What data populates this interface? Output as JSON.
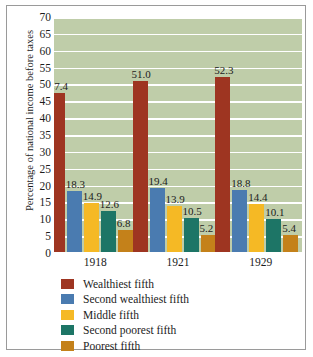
{
  "chart_data": {
    "type": "bar",
    "title": "",
    "subtitle": "",
    "xlabel": "",
    "ylabel": "Percentage of national income before taxes",
    "categories": [
      "1918",
      "1921",
      "1929"
    ],
    "ylim": [
      0,
      70
    ],
    "ytick_step": 5,
    "yticks": [
      "70",
      "65",
      "60",
      "55",
      "50",
      "45",
      "40",
      "35",
      "30",
      "25",
      "20",
      "15",
      "10",
      "5",
      "0"
    ],
    "grid": true,
    "legend_position": "bottom-left",
    "series": [
      {
        "name": "Wealthiest fifth",
        "color": "#9e3521",
        "values": [
          47.4,
          51.0,
          52.3
        ],
        "labels": [
          "47.4",
          "51.0",
          "52.3"
        ]
      },
      {
        "name": "Second wealthiest fifth",
        "color": "#4a7bb0",
        "values": [
          18.3,
          19.4,
          18.8
        ],
        "labels": [
          "18.3",
          "19.4",
          "18.8"
        ]
      },
      {
        "name": "Middle fifth",
        "color": "#f5b925",
        "values": [
          14.9,
          13.9,
          14.4
        ],
        "labels": [
          "14.9",
          "13.9",
          "14.4"
        ]
      },
      {
        "name": "Second poorest fifth",
        "color": "#1d7566",
        "values": [
          12.6,
          10.5,
          10.1
        ],
        "labels": [
          "12.6",
          "10.5",
          "10.1"
        ]
      },
      {
        "name": "Poorest fifth",
        "color": "#c4811a",
        "values": [
          6.8,
          5.2,
          5.4
        ],
        "labels": [
          "6.8",
          "5.2",
          "5.4"
        ]
      }
    ],
    "plot_background_color": "#bfcda9",
    "gridline_color": "#ffffff",
    "frame_color": "#9a9a9a"
  }
}
